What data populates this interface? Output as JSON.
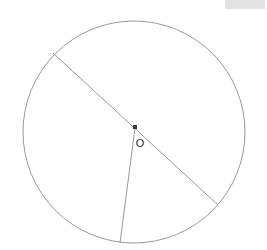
{
  "figure": {
    "background_color": "#ffffff",
    "stroke_color": "#999999",
    "center_dot_color": "#3a3a3a",
    "label_color": "#2b2b2b",
    "canvas": {
      "width": 267,
      "height": 250
    },
    "circle": {
      "name": "circle-outline",
      "cx": 134,
      "cy": 132,
      "r": 111,
      "stroke_width": 1
    },
    "center_point": {
      "name": "center-point-o",
      "x": 135,
      "y": 127,
      "size": 4
    },
    "center_label": {
      "text": "O",
      "x": 140,
      "y": 147
    },
    "segments": [
      {
        "name": "chord-upper-left-to-lower-right",
        "x1": 53,
        "y1": 53,
        "x2": 218,
        "y2": 205,
        "stroke_width": 1
      },
      {
        "name": "radius-center-to-bottom",
        "x1": 135,
        "y1": 128,
        "x2": 120,
        "y2": 243,
        "stroke_width": 1
      }
    ]
  },
  "corner_swatch": {
    "name": "top-right-blank-swatch",
    "color": "#e3e3e3",
    "label": ""
  }
}
